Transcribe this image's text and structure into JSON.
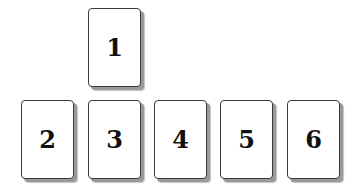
{
  "diagram": {
    "cards": [
      {
        "label": "1",
        "x": 88,
        "y": 8
      },
      {
        "label": "2",
        "x": 21,
        "y": 100
      },
      {
        "label": "3",
        "x": 88,
        "y": 100
      },
      {
        "label": "4",
        "x": 154,
        "y": 100
      },
      {
        "label": "5",
        "x": 220,
        "y": 100
      },
      {
        "label": "6",
        "x": 287,
        "y": 100
      }
    ]
  }
}
